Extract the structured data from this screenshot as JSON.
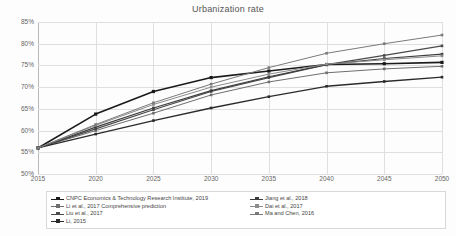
{
  "chart_data": {
    "type": "line",
    "title": "Urbanization rate",
    "xlabel": "",
    "ylabel": "",
    "x": [
      2015,
      2020,
      2025,
      2030,
      2035,
      2040,
      2045,
      2050
    ],
    "xlim": [
      2015,
      2050
    ],
    "ylim": [
      0.5,
      0.85
    ],
    "ytick_labels": [
      "85%",
      "80%",
      "75%",
      "70%",
      "65%",
      "60%",
      "55%",
      "50%"
    ],
    "ytick_values": [
      0.85,
      0.8,
      0.75,
      0.7,
      0.65,
      0.6,
      0.55,
      0.5
    ],
    "xtick_labels": [
      "2015",
      "2020",
      "2025",
      "2030",
      "2035",
      "2040",
      "2045",
      "2050"
    ],
    "grid": true,
    "legend_position": "bottom",
    "series": [
      {
        "name": "CNPC Economics & Technology Research Institute, 2019",
        "color": "#1a1a1a",
        "width": 1.6,
        "marker": "square",
        "values": [
          0.56,
          0.638,
          0.69,
          0.722,
          0.737,
          0.752,
          0.754,
          0.757
        ]
      },
      {
        "name": "Li et al., 2017 Comprehensive prediction",
        "color": "#6e6e6e",
        "width": 1.0,
        "marker": "square",
        "values": [
          0.56,
          0.6,
          0.64,
          0.682,
          0.712,
          0.733,
          0.742,
          0.748
        ]
      },
      {
        "name": "Liu et al., 2017",
        "color": "#4a4a4a",
        "width": 1.2,
        "marker": "square",
        "values": [
          0.56,
          0.604,
          0.648,
          0.69,
          0.722,
          0.752,
          0.773,
          0.795
        ]
      },
      {
        "name": "Li, 2015",
        "color": "#2b2b2b",
        "width": 1.3,
        "marker": "square",
        "values": [
          0.56,
          0.592,
          0.623,
          0.652,
          0.678,
          0.702,
          0.713,
          0.723
        ]
      },
      {
        "name": "Jiang et al., 2018",
        "color": "#3d3d3d",
        "width": 1.2,
        "marker": "square",
        "values": [
          0.56,
          0.608,
          0.652,
          0.692,
          0.724,
          0.752,
          0.766,
          0.776
        ]
      },
      {
        "name": "Dai et al., 2017",
        "color": "#8c8c8c",
        "width": 1.0,
        "marker": "square",
        "values": [
          0.56,
          0.612,
          0.66,
          0.7,
          0.73,
          0.753,
          0.763,
          0.772
        ]
      },
      {
        "name": "Ma and Chen, 2016",
        "color": "#7a7a7a",
        "width": 1.0,
        "marker": "square",
        "values": [
          0.56,
          0.614,
          0.664,
          0.707,
          0.745,
          0.778,
          0.8,
          0.82
        ]
      }
    ]
  },
  "legend": {
    "column_left": [
      "CNPC Economics & Technology Research Institute, 2019",
      "Li et al., 2017 Comprehensive prediction",
      "Liu et al., 2017",
      "Li, 2015"
    ],
    "column_right": [
      "Jiang et al., 2018",
      "Dai et al., 2017",
      "Ma and Chen, 2016"
    ]
  }
}
